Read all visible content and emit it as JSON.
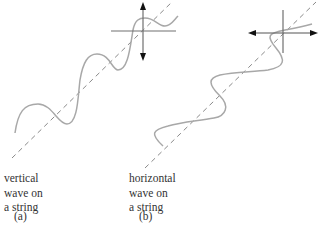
{
  "panels": [
    {
      "id": "a",
      "caption": "(a)",
      "label_lines": [
        "vertical",
        "wave on",
        "a string"
      ],
      "polarization": "vertical"
    },
    {
      "id": "b",
      "caption": "(b)",
      "label_lines": [
        "horizontal",
        "wave on",
        "a string"
      ],
      "polarization": "horizontal"
    }
  ],
  "colors": {
    "wave": "#a8a8a8",
    "axis": "#707070",
    "dashed": "#8a8a8a",
    "arrow": "#111111",
    "text": "#333333"
  }
}
